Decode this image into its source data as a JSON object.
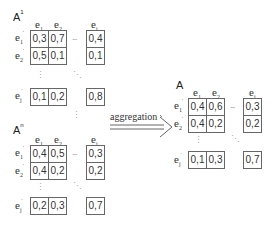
{
  "matrices": [
    {
      "name": "A",
      "superscript": "1",
      "col_labels": [
        "e",
        "e",
        "e"
      ],
      "col_subs": [
        "1",
        "2",
        "i"
      ],
      "row_labels": [
        "e",
        "e",
        "e"
      ],
      "row_subs": [
        "1",
        "2",
        "j"
      ],
      "rows": [
        [
          "0,3",
          "0,7",
          "0,4"
        ],
        [
          "0,5",
          "0,1",
          "0,1"
        ],
        [
          "0,1",
          "0,2",
          "0,8"
        ]
      ]
    },
    {
      "name": "A",
      "superscript": "n",
      "col_labels": [
        "e",
        "e",
        "e"
      ],
      "col_subs": [
        "1",
        "2",
        "i"
      ],
      "row_labels": [
        "e",
        "e",
        "e"
      ],
      "row_subs": [
        "1",
        "2",
        "j"
      ],
      "rows": [
        [
          "0,4",
          "0,5",
          "0,3"
        ],
        [
          "0,4",
          "0,2",
          "0,2"
        ],
        [
          "0,2",
          "0,3",
          "0,7"
        ]
      ]
    },
    {
      "name": "A",
      "superscript": "",
      "col_labels": [
        "e",
        "e",
        "e"
      ],
      "col_subs": [
        "1",
        "2",
        "i"
      ],
      "row_labels": [
        "e",
        "e",
        "e"
      ],
      "row_subs": [
        "1",
        "2",
        "j"
      ],
      "rows": [
        [
          "0,4",
          "0,6",
          "0,3"
        ],
        [
          "0,4",
          "0,2",
          "0,2"
        ],
        [
          "0,1",
          "0,3",
          "0,7"
        ]
      ]
    }
  ],
  "arrow": {
    "label": "aggregation"
  },
  "ellipsis": {
    "horizontal": "...",
    "vertical": "⋮",
    "diagonal": "⋱"
  }
}
